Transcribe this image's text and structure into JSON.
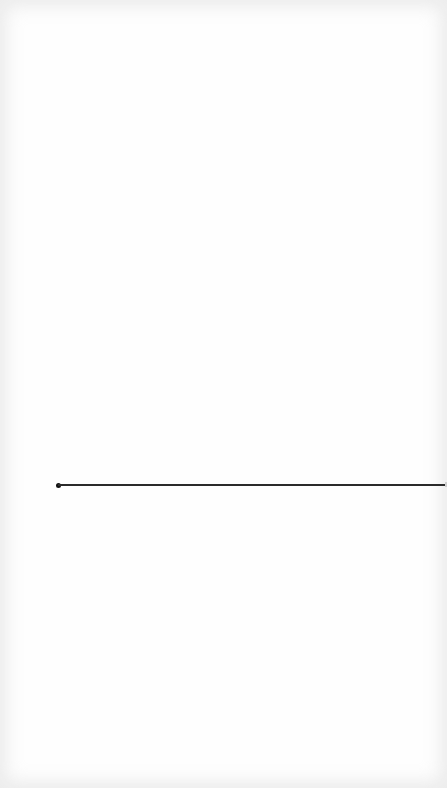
{
  "canvas": {
    "width": 447,
    "height": 788,
    "background": "#fefefe"
  },
  "line": {
    "start": {
      "x": 58,
      "y": 485
    },
    "end": {
      "x": 447,
      "y": 485
    },
    "thickness": 2,
    "color": "#2a2a2a",
    "start_point": {
      "shape": "dot",
      "diameter": 5,
      "color": "#111111"
    }
  }
}
